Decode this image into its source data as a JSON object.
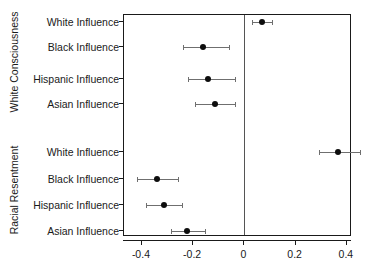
{
  "chart_data": {
    "type": "scatter",
    "plot_style": "coefficient-dot-and-whisker",
    "title": "",
    "subtitle": "",
    "xlabel": "",
    "ylabel": "",
    "xlim": [
      -0.47,
      0.42
    ],
    "xticks": [
      -0.4,
      -0.2,
      0,
      0.2,
      0.4
    ],
    "xticklabels": [
      "-0.4",
      "-0.2",
      "0",
      "0.2",
      "0.4"
    ],
    "grid": false,
    "legend": "none",
    "reference_line": 0,
    "groups": [
      {
        "name": "White Consciousness",
        "points": [
          {
            "label": "White Influence",
            "estimate": 0.07,
            "ci_low": 0.029,
            "ci_high": 0.109
          },
          {
            "label": "Black Influence",
            "estimate": -0.162,
            "ci_low": -0.24,
            "ci_high": -0.062
          },
          {
            "label": "Hispanic Influence",
            "estimate": -0.144,
            "ci_low": -0.219,
            "ci_high": -0.037
          },
          {
            "label": "Asian Influence",
            "estimate": -0.116,
            "ci_low": -0.194,
            "ci_high": -0.036
          }
        ]
      },
      {
        "name": "Racial Resentment",
        "points": [
          {
            "label": "White Influence",
            "estimate": 0.364,
            "ci_low": 0.293,
            "ci_high": 0.452
          },
          {
            "label": "Black Influence",
            "estimate": -0.343,
            "ci_low": -0.42,
            "ci_high": -0.258
          },
          {
            "label": "Hispanic Influence",
            "estimate": -0.314,
            "ci_low": -0.383,
            "ci_high": -0.242
          },
          {
            "label": "Asian Influence",
            "estimate": -0.224,
            "ci_low": -0.285,
            "ci_high": -0.155
          }
        ]
      }
    ]
  }
}
